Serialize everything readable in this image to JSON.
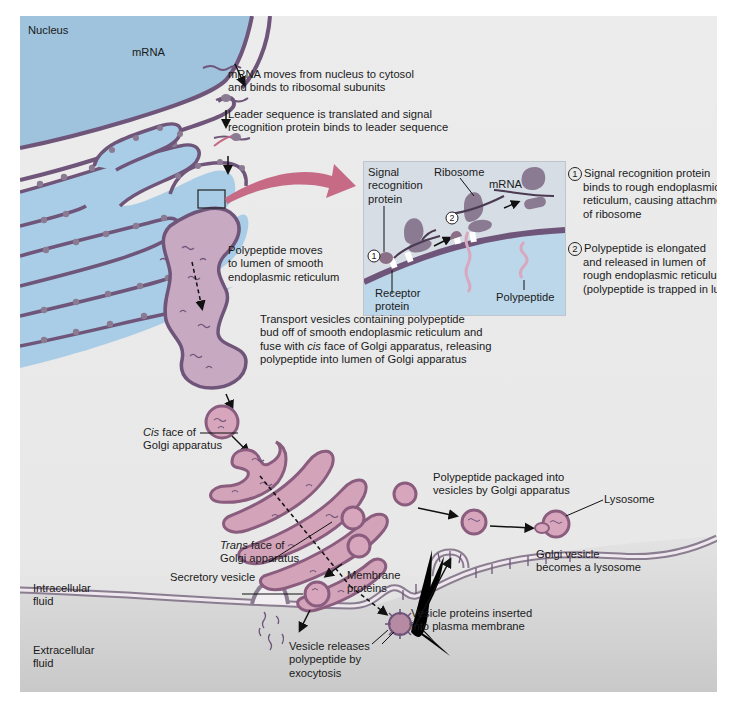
{
  "diagram": {
    "colors": {
      "frame_bg": "#ececec",
      "nucleus_fill": "#9fc3dd",
      "er_fill": "#a9cde6",
      "smooth_er_fill": "#c8a9c2",
      "membrane": "#6e5579",
      "ribosome": "#8a7a92",
      "vesicle_fill": "#d7a6bd",
      "vesicle_edge": "#8a5c7e",
      "golgi_fill": "#d3a3b9",
      "golgi_edge": "#8a5c7e",
      "mrna": "#6e5579",
      "inset_bg": "#d6dde4",
      "big_arrow": "#c66a86",
      "plasma_membrane": "#8a7d90",
      "extracellular": "#cfcfcf"
    },
    "labels": {
      "nucleus": "Nucleus",
      "mrna": "mRNA",
      "step_mrna_moves": [
        "mRNA moves from nucleus to cytosol",
        "and binds to ribosomal subunits"
      ],
      "step_leader": [
        "Leader sequence is translated and signal",
        "recognition protein binds to leader sequence"
      ],
      "polypeptide_moves": [
        "Polypeptide moves",
        "to lumen of smooth",
        "endoplasmic reticulum"
      ],
      "transport_vesicles": {
        "line1": "Transport vesicles containing polypeptide",
        "line2": "bud off of smooth endoplasmic reticulum and",
        "line3_pre": "fuse with ",
        "line3_italic": "cis",
        "line3_post": " face of Golgi apparatus, releasing",
        "line4": "polypeptide into lumen of Golgi apparatus"
      },
      "cis_face": {
        "italic": "Cis",
        "rest": " face of",
        "line2": "Golgi apparatus"
      },
      "trans_face": {
        "italic": "Trans",
        "rest": " face of",
        "line2": "Golgi apparatus"
      },
      "secretory_vesicle": "Secretory vesicle",
      "membrane_proteins": [
        "Membrane",
        "proteins"
      ],
      "polypeptide_packaged": [
        "Polypeptide packaged into",
        "vesicles by Golgi apparatus"
      ],
      "lysosome": "Lysosome",
      "golgi_vesicle_lysosome": [
        "Golgi vesicle",
        "becomes a lysosome"
      ],
      "vesicle_proteins_inserted": [
        "Vesicle proteins inserted",
        "into plasma membrane"
      ],
      "intracellular_fluid": [
        "Intracellular",
        "fluid"
      ],
      "extracellular_fluid": [
        "Extracellular",
        "fluid"
      ],
      "vesicle_releases": [
        "Vesicle releases",
        "polypeptide by",
        "exocytosis"
      ]
    },
    "inset": {
      "signal_recognition_protein": [
        "Signal",
        "recognition",
        "protein"
      ],
      "ribosome": "Ribosome",
      "mrna": "mRNA",
      "receptor_protein": [
        "Receptor",
        "protein"
      ],
      "polypeptide": "Polypeptide",
      "marker_1": "1",
      "marker_2": "2"
    },
    "notes": [
      {
        "number": "1",
        "lines": [
          "Signal recognition protein",
          "binds to rough endoplasmic",
          "reticulum, causing attachment",
          "of ribosome"
        ]
      },
      {
        "number": "2",
        "lines": [
          "Polypeptide is elongated",
          "and released in lumen of",
          "rough endoplasmic reticulum",
          "(polypeptide is trapped in lumen)"
        ]
      }
    ]
  }
}
